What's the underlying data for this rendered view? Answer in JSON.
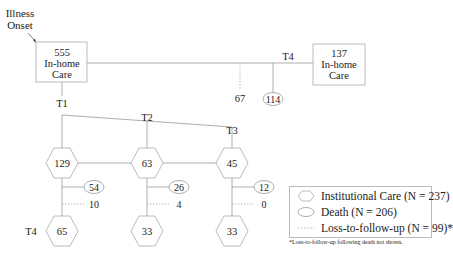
{
  "diagram": {
    "onset_label": [
      "Illness",
      "Onset"
    ],
    "start_box": {
      "count": "555",
      "label": [
        "In-home",
        "Care"
      ]
    },
    "end_box": {
      "count": "137",
      "label": [
        "In-home",
        "Care"
      ]
    },
    "time_labels": {
      "t1": "T1",
      "t2": "T2",
      "t3": "T3",
      "t4_top": "T4",
      "t4_bottom": "T4"
    },
    "top_branch": {
      "loss": "67",
      "death": "114"
    },
    "institutional": [
      {
        "time": "T1",
        "count": "129",
        "death": "54",
        "loss": "10",
        "t4_count": "65"
      },
      {
        "time": "T2",
        "count": "63",
        "death": "26",
        "loss": "4",
        "t4_count": "33"
      },
      {
        "time": "T3",
        "count": "45",
        "death": "12",
        "loss": "0",
        "t4_count": "33"
      }
    ]
  },
  "legend": {
    "items": [
      {
        "symbol": "hexagon",
        "label": "Institutional Care (N = 237)"
      },
      {
        "symbol": "ellipse",
        "label": "Death (N = 206)"
      },
      {
        "symbol": "dotted-line",
        "label": "Loss-to-follow-up (N = 99)*"
      }
    ],
    "footnote": "*Loss-to-follow-up following death not shown."
  }
}
